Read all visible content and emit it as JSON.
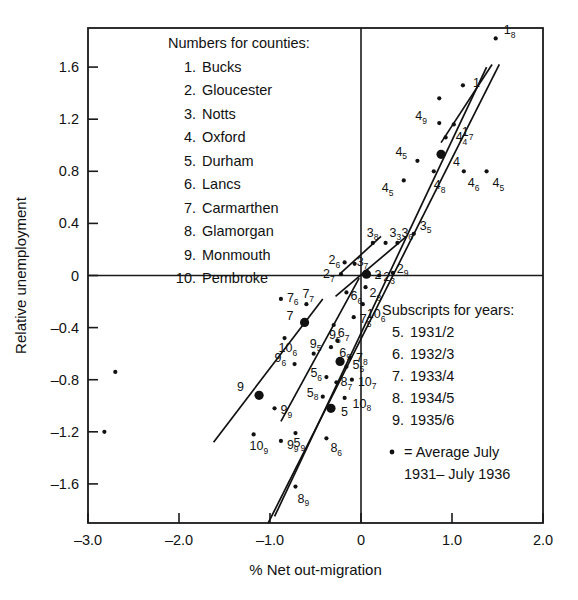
{
  "chart_data": {
    "type": "scatter",
    "title": "",
    "xlabel": "% Net out-migration",
    "ylabel": "Relative unemployment",
    "xlim": [
      -3.0,
      2.0
    ],
    "ylim": [
      -1.9,
      1.9
    ],
    "xticks": [
      "-3.0",
      "-2.0",
      "-1.0",
      "0",
      "1.0",
      "2.0"
    ],
    "xtickvals": [
      -3.0,
      -2.0,
      -1.0,
      0,
      1.0,
      2.0
    ],
    "yticks": [
      "1.6",
      "1.2",
      "0.8",
      "0.4",
      "0",
      "-0.4",
      "-0.8",
      "-1.2",
      "-1.6"
    ],
    "ytickvals": [
      1.6,
      1.2,
      0.8,
      0.4,
      0,
      -0.4,
      -0.8,
      -1.2,
      -1.6
    ],
    "grid": false,
    "legend_position": "inside-top-left and inside-bottom-right",
    "marker_note": "Large filled dots are averages July 1931 - July 1936; small dots are individual yearly observations labelled county-subscript-year",
    "points": [
      {
        "county": 1,
        "year": 8,
        "label": "1",
        "sublabel": "8",
        "x": 1.48,
        "y": 1.82,
        "size": "small",
        "lx": 8,
        "ly": -4
      },
      {
        "county": 1,
        "year": 0,
        "label": "1",
        "sublabel": "",
        "x": 1.12,
        "y": 1.46,
        "size": "small",
        "lx": 10,
        "ly": 2
      },
      {
        "county": 1,
        "year": 0,
        "label": "",
        "sublabel": "",
        "x": 0.86,
        "y": 1.36,
        "size": "small",
        "lx": 0,
        "ly": 0
      },
      {
        "county": 1,
        "year": 7,
        "label": "1",
        "sublabel": "7",
        "x": 1.02,
        "y": 1.16,
        "size": "small",
        "lx": 8,
        "ly": 12
      },
      {
        "county": 4,
        "year": 9,
        "label": "4",
        "sublabel": "9",
        "x": 0.86,
        "y": 1.17,
        "size": "small",
        "lx": -24,
        "ly": -3
      },
      {
        "county": 4,
        "year": 4,
        "label": "4",
        "sublabel": "4",
        "x": 0.93,
        "y": 1.06,
        "size": "small",
        "lx": 10,
        "ly": 4
      },
      {
        "county": 4,
        "year": 0,
        "label": "4",
        "sublabel": "",
        "x": 0.88,
        "y": 0.93,
        "size": "big",
        "lx": 12,
        "ly": 12
      },
      {
        "county": 4,
        "year": 5,
        "label": "4",
        "sublabel": "5",
        "x": 0.62,
        "y": 0.88,
        "size": "small",
        "lx": -22,
        "ly": -5
      },
      {
        "county": 4,
        "year": 6,
        "label": "4",
        "sublabel": "6",
        "x": 1.13,
        "y": 0.8,
        "size": "small",
        "lx": 4,
        "ly": 16
      },
      {
        "county": 4,
        "year": 5,
        "label": "4",
        "sublabel": "5",
        "x": 1.38,
        "y": 0.8,
        "size": "small",
        "lx": 6,
        "ly": 16
      },
      {
        "county": 4,
        "year": 8,
        "label": "4",
        "sublabel": "8",
        "x": 0.8,
        "y": 0.8,
        "size": "small",
        "lx": 0,
        "ly": 18
      },
      {
        "county": 4,
        "year": 5,
        "label": "4",
        "sublabel": "5",
        "x": 0.47,
        "y": 0.73,
        "size": "small",
        "lx": -22,
        "ly": 12
      },
      {
        "county": 3,
        "year": 5,
        "label": "3",
        "sublabel": "5",
        "x": 0.58,
        "y": 0.32,
        "size": "small",
        "lx": 6,
        "ly": -4
      },
      {
        "county": 3,
        "year": 8,
        "label": "3",
        "sublabel": "8",
        "x": 0.13,
        "y": 0.25,
        "size": "small",
        "lx": -6,
        "ly": -6
      },
      {
        "county": 3,
        "year": 3,
        "label": "3",
        "sublabel": "3",
        "x": 0.27,
        "y": 0.25,
        "size": "small",
        "lx": 4,
        "ly": -6
      },
      {
        "county": 3,
        "year": 6,
        "label": "3",
        "sublabel": "6",
        "x": 0.4,
        "y": 0.25,
        "size": "small",
        "lx": 4,
        "ly": -6
      },
      {
        "county": 2,
        "year": 6,
        "label": "2",
        "sublabel": "6",
        "x": -0.18,
        "y": 0.1,
        "size": "small",
        "lx": -16,
        "ly": 2
      },
      {
        "county": 3,
        "year": 7,
        "label": "3",
        "sublabel": "7",
        "x": -0.07,
        "y": 0.09,
        "size": "small",
        "lx": 2,
        "ly": 2
      },
      {
        "county": 2,
        "year": 7,
        "label": "2",
        "sublabel": "7",
        "x": -0.22,
        "y": 0.01,
        "size": "small",
        "lx": -18,
        "ly": 4
      },
      {
        "county": 2,
        "year": 0,
        "label": "2",
        "sublabel": "",
        "x": 0.06,
        "y": 0.01,
        "size": "big",
        "lx": 8,
        "ly": 5
      },
      {
        "county": 2,
        "year": 3,
        "label": "2",
        "sublabel": "3",
        "x": 0.2,
        "y": 0.0,
        "size": "small",
        "lx": 4,
        "ly": 5
      },
      {
        "county": 2,
        "year": 9,
        "label": "2",
        "sublabel": "9",
        "x": 0.35,
        "y": 0.02,
        "size": "small",
        "lx": 4,
        "ly": 0
      },
      {
        "county": 2,
        "year": 8,
        "label": "2",
        "sublabel": "8",
        "x": 0.05,
        "y": -0.09,
        "size": "small",
        "lx": 4,
        "ly": 10
      },
      {
        "county": 6,
        "year": 6,
        "label": "6",
        "sublabel": "6",
        "x": -0.16,
        "y": -0.13,
        "size": "small",
        "lx": 4,
        "ly": 8
      },
      {
        "county": 10,
        "year": 6,
        "label": "10",
        "sublabel": "6",
        "x": 0.02,
        "y": -0.22,
        "size": "small",
        "lx": 4,
        "ly": 14
      },
      {
        "county": 7,
        "year": 6,
        "label": "7",
        "sublabel": "6",
        "x": -0.88,
        "y": -0.18,
        "size": "small",
        "lx": 6,
        "ly": 3
      },
      {
        "county": 7,
        "year": 7,
        "label": "7",
        "sublabel": "7",
        "x": -0.6,
        "y": -0.22,
        "size": "small",
        "lx": -4,
        "ly": -6
      },
      {
        "county": 7,
        "year": 0,
        "label": "7",
        "sublabel": "",
        "x": -0.62,
        "y": -0.36,
        "size": "big",
        "lx": -18,
        "ly": -2
      },
      {
        "county": 7,
        "year": 5,
        "label": "7",
        "sublabel": "5",
        "x": -0.08,
        "y": -0.32,
        "size": "small",
        "lx": 6,
        "ly": 6
      },
      {
        "county": 6,
        "year": 7,
        "label": "6",
        "sublabel": "7",
        "x": -0.3,
        "y": -0.38,
        "size": "small",
        "lx": 4,
        "ly": 12
      },
      {
        "county": 6,
        "year": 9,
        "label": "6",
        "sublabel": "9",
        "x": -0.26,
        "y": -0.5,
        "size": "small",
        "lx": 2,
        "ly": 16
      },
      {
        "county": 10,
        "year": 6,
        "label": "10",
        "sublabel": "6",
        "x": -0.84,
        "y": -0.48,
        "size": "small",
        "lx": -6,
        "ly": 14
      },
      {
        "county": 9,
        "year": 5,
        "label": "9",
        "sublabel": "5",
        "x": -0.52,
        "y": -0.6,
        "size": "small",
        "lx": -4,
        "ly": -6
      },
      {
        "county": 9,
        "year": 5,
        "label": "9",
        "sublabel": "5",
        "x": -0.33,
        "y": -0.55,
        "size": "small",
        "lx": -2,
        "ly": -8
      },
      {
        "county": 9,
        "year": 6,
        "label": "9",
        "sublabel": "6",
        "x": -0.73,
        "y": -0.68,
        "size": "small",
        "lx": -20,
        "ly": -2
      },
      {
        "county": 5,
        "year": 5,
        "label": "5",
        "sublabel": "5",
        "x": -0.16,
        "y": -0.7,
        "size": "small",
        "lx": 6,
        "ly": 2
      },
      {
        "county": 5,
        "year": 6,
        "label": "5",
        "sublabel": "6",
        "x": -0.38,
        "y": -0.78,
        "size": "small",
        "lx": -16,
        "ly": 0
      },
      {
        "county": 5,
        "year": 0,
        "label": "",
        "sublabel": "",
        "x": -0.23,
        "y": -0.66,
        "size": "big",
        "lx": 0,
        "ly": 0
      },
      {
        "county": 8,
        "year": 7,
        "label": "8",
        "sublabel": "7",
        "x": -0.27,
        "y": -0.82,
        "size": "small",
        "lx": 4,
        "ly": 4
      },
      {
        "county": 10,
        "year": 7,
        "label": "10",
        "sublabel": "7",
        "x": -0.1,
        "y": -0.8,
        "size": "small",
        "lx": 6,
        "ly": 6
      },
      {
        "county": 9,
        "year": 0,
        "label": "9",
        "sublabel": "",
        "x": -1.12,
        "y": -0.92,
        "size": "big",
        "lx": -22,
        "ly": -4
      },
      {
        "county": 5,
        "year": 8,
        "label": "5",
        "sublabel": "8",
        "x": -0.42,
        "y": -0.93,
        "size": "small",
        "lx": -16,
        "ly": 0
      },
      {
        "county": 10,
        "year": 8,
        "label": "10",
        "sublabel": "8",
        "x": -0.18,
        "y": -0.94,
        "size": "small",
        "lx": 8,
        "ly": 10
      },
      {
        "county": 5,
        "year": 0,
        "label": "5",
        "sublabel": "",
        "x": -0.33,
        "y": -1.02,
        "size": "big",
        "lx": 10,
        "ly": 8
      },
      {
        "county": 9,
        "year": 9,
        "label": "9",
        "sublabel": "9",
        "x": -0.95,
        "y": -1.02,
        "size": "small",
        "lx": 6,
        "ly": 6
      },
      {
        "county": 5,
        "year": 9,
        "label": "5",
        "sublabel": "9",
        "x": -0.72,
        "y": -1.21,
        "size": "small",
        "lx": -2,
        "ly": 14
      },
      {
        "county": 10,
        "year": 9,
        "label": "10",
        "sublabel": "9",
        "x": -1.18,
        "y": -1.22,
        "size": "small",
        "lx": -4,
        "ly": 16
      },
      {
        "county": 9,
        "year": 9,
        "label": "9",
        "sublabel": "9",
        "x": -0.88,
        "y": -1.27,
        "size": "small",
        "lx": 6,
        "ly": 8
      },
      {
        "county": 8,
        "year": 6,
        "label": "8",
        "sublabel": "6",
        "x": -0.38,
        "y": -1.25,
        "size": "small",
        "lx": 4,
        "ly": 14
      },
      {
        "county": 7,
        "year": 8,
        "label": "7",
        "sublabel": "8",
        "x": -0.12,
        "y": -0.63,
        "size": "small",
        "lx": 6,
        "ly": 4
      },
      {
        "county": 8,
        "year": 9,
        "label": "8",
        "sublabel": "9",
        "x": -0.72,
        "y": -1.62,
        "size": "small",
        "lx": 2,
        "ly": 16
      },
      {
        "county": 0,
        "year": 0,
        "label": "",
        "sublabel": "",
        "x": -2.7,
        "y": -0.74,
        "size": "small",
        "lx": 0,
        "ly": 0
      },
      {
        "county": 0,
        "year": 0,
        "label": "",
        "sublabel": "",
        "x": -2.82,
        "y": -1.2,
        "size": "small",
        "lx": 0,
        "ly": 0
      }
    ],
    "trendlines": [
      {
        "name": "line-main-steep",
        "x1": -1.02,
        "y1": -1.9,
        "x2": 1.52,
        "y2": 1.62
      },
      {
        "name": "line-main-second",
        "x1": -0.95,
        "y1": -1.85,
        "x2": 1.38,
        "y2": 1.6
      },
      {
        "name": "line-upper-short",
        "x1": 0.88,
        "y1": 1.02,
        "x2": 1.44,
        "y2": 1.62
      },
      {
        "name": "line-lower-left",
        "x1": -1.62,
        "y1": -1.28,
        "x2": -0.42,
        "y2": -0.18
      },
      {
        "name": "line-mid-left",
        "x1": -0.88,
        "y1": -1.12,
        "x2": -0.02,
        "y2": -0.02
      },
      {
        "name": "line-center-fan-a",
        "x1": -0.28,
        "y1": -0.16,
        "x2": 0.5,
        "y2": 0.3
      },
      {
        "name": "line-center-fan-b",
        "x1": -0.22,
        "y1": 0.02,
        "x2": 0.22,
        "y2": 0.3
      }
    ]
  },
  "county_legend": {
    "heading": "Numbers for counties:",
    "items": [
      {
        "n": "1.",
        "name": "Bucks"
      },
      {
        "n": "2.",
        "name": "Gloucester"
      },
      {
        "n": "3.",
        "name": "Notts"
      },
      {
        "n": "4.",
        "name": "Oxford"
      },
      {
        "n": "5.",
        "name": "Durham"
      },
      {
        "n": "6.",
        "name": "Lancs"
      },
      {
        "n": "7.",
        "name": "Carmarthen"
      },
      {
        "n": "8.",
        "name": "Glamorgan"
      },
      {
        "n": "9.",
        "name": "Monmouth"
      },
      {
        "n": "10.",
        "name": "Pembroke"
      }
    ]
  },
  "year_legend": {
    "heading": "Subscripts for years:",
    "items": [
      {
        "n": "5.",
        "range": "1931/2"
      },
      {
        "n": "6.",
        "range": "1932/3"
      },
      {
        "n": "7.",
        "range": "1933/4"
      },
      {
        "n": "8.",
        "range": "1934/5"
      },
      {
        "n": "9.",
        "range": "1935/6"
      }
    ],
    "marker_line1": "= Average July",
    "marker_line2": "1931– July 1936"
  }
}
